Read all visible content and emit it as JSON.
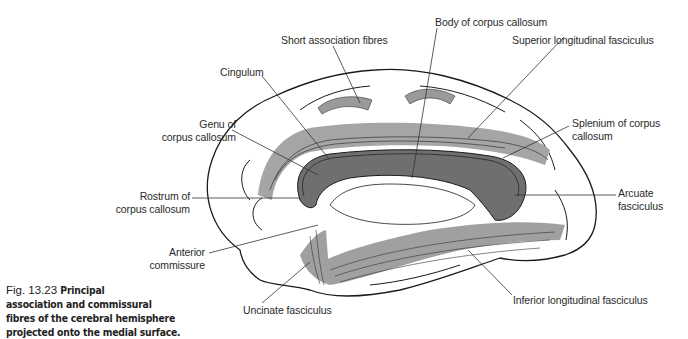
{
  "figure": {
    "caption_number": "Fig. 13.23",
    "caption_bold_line1": "Principal",
    "caption_bold_line2": "association and commissural",
    "caption_bold_line3": "fibres of the cerebral hemisphere",
    "caption_bold_line4": "projected onto the medial surface.",
    "colors": {
      "fibre_shade": "#9a9a9a",
      "corpus_callosum": "#6f6f6f",
      "outline": "#1a1a1a",
      "leader": "#333333"
    }
  },
  "labels": {
    "short_association": "Short association fibres",
    "body_cc": "Body of corpus callosum",
    "cingulum": "Cingulum",
    "superior_long": "Superior longitudinal fasciculus",
    "genu_1": "Genu of",
    "genu_2": "corpus callosum",
    "splenium_1": "Splenium of corpus",
    "splenium_2": "callosum",
    "rostrum_1": "Rostrum of",
    "rostrum_2": "corpus callosum",
    "arcuate_1": "Arcuate",
    "arcuate_2": "fasciculus",
    "anterior_comm_1": "Anterior",
    "anterior_comm_2": "commissure",
    "uncinate": "Uncinate fasciculus",
    "inferior_long": "Inferior longitudinal fasciculus"
  }
}
